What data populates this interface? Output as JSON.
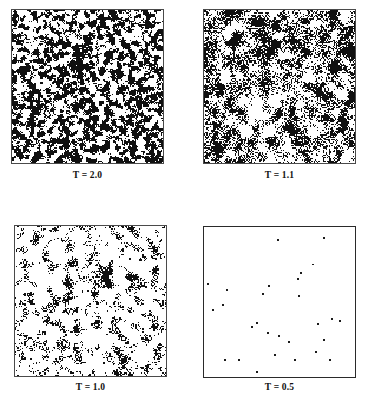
{
  "figure": {
    "background_color": "#ffffff",
    "ink_color": "#101010",
    "width": 366,
    "height": 403,
    "columns": 2,
    "rows": 2
  },
  "panels": [
    {
      "id": "panel-t-2-0",
      "caption": "T = 2.0",
      "temperature": 2.0,
      "box": {
        "x": 11,
        "y": 9,
        "w": 153,
        "h": 155
      },
      "caption_y": 170,
      "border_style": "softborder",
      "black_fraction": 0.5,
      "correlation_length": 1.6,
      "seed": 20001,
      "render_mode": "noise",
      "description": "dense fine-grained salt-and-pepper domains, no long-range order"
    },
    {
      "id": "panel-t-1-1",
      "caption": "T = 1.1",
      "temperature": 1.1,
      "box": {
        "x": 203,
        "y": 9,
        "w": 153,
        "h": 155
      },
      "caption_y": 170,
      "border_style": "softborder",
      "black_fraction": 0.44,
      "correlation_length": 3.1,
      "seed": 11002,
      "render_mode": "noise",
      "description": "coarser clustered domains near criticality, large connected black clusters"
    },
    {
      "id": "panel-t-1-0",
      "caption": "T = 1.0",
      "temperature": 1.0,
      "box": {
        "x": 14,
        "y": 225,
        "w": 153,
        "h": 152
      },
      "caption_y": 382,
      "border_style": "softborder",
      "black_fraction": 0.17,
      "correlation_length": 2.2,
      "seed": 10003,
      "render_mode": "noise",
      "description": "mostly white background with sparse small black clusters and speckles"
    },
    {
      "id": "panel-t-0-5",
      "caption": "T = 0.5",
      "temperature": 0.5,
      "box": {
        "x": 203,
        "y": 226,
        "w": 153,
        "h": 152
      },
      "caption_y": 382,
      "border_style": "bordered",
      "black_fraction": 0.004,
      "correlation_length": 0,
      "seed": 5004,
      "render_mode": "dots",
      "description": "nearly fully ordered, only isolated single flipped spins remain",
      "dots": [
        {
          "x": 0.485,
          "y": 0.065
        },
        {
          "x": 0.8,
          "y": 0.055
        },
        {
          "x": 0.72,
          "y": 0.235
        },
        {
          "x": 0.64,
          "y": 0.3
        },
        {
          "x": 0.01,
          "y": 0.37
        },
        {
          "x": 0.135,
          "y": 0.415
        },
        {
          "x": 0.105,
          "y": 0.512
        },
        {
          "x": 0.04,
          "y": 0.545
        },
        {
          "x": 0.425,
          "y": 0.385
        },
        {
          "x": 0.385,
          "y": 0.44
        },
        {
          "x": 0.62,
          "y": 0.335
        },
        {
          "x": 0.625,
          "y": 0.455
        },
        {
          "x": 0.34,
          "y": 0.635
        },
        {
          "x": 0.31,
          "y": 0.665
        },
        {
          "x": 0.415,
          "y": 0.7
        },
        {
          "x": 0.49,
          "y": 0.72
        },
        {
          "x": 0.56,
          "y": 0.77
        },
        {
          "x": 0.855,
          "y": 0.61
        },
        {
          "x": 0.905,
          "y": 0.62
        },
        {
          "x": 0.76,
          "y": 0.645
        },
        {
          "x": 0.8,
          "y": 0.76
        },
        {
          "x": 0.735,
          "y": 0.835
        },
        {
          "x": 0.465,
          "y": 0.855
        },
        {
          "x": 0.6,
          "y": 0.895
        },
        {
          "x": 0.84,
          "y": 0.895
        },
        {
          "x": 0.12,
          "y": 0.895
        },
        {
          "x": 0.215,
          "y": 0.89
        },
        {
          "x": 0.345,
          "y": 0.975
        }
      ]
    }
  ]
}
